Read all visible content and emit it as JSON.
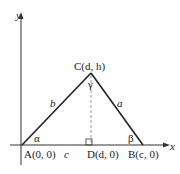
{
  "diagram": {
    "axes": {
      "x_label": "x",
      "y_label": "y"
    },
    "points": {
      "A": {
        "label": "A(0, 0)"
      },
      "B": {
        "label": "B(c, 0)"
      },
      "C": {
        "label": "C(d, h)"
      },
      "D": {
        "label": "D(d, 0)"
      }
    },
    "sides": {
      "a": "a",
      "b": "b",
      "c": "c"
    },
    "angles": {
      "alpha": "α",
      "beta": "β",
      "gamma": "γ"
    },
    "colors": {
      "line": "#222222",
      "dashed": "#999999"
    }
  }
}
